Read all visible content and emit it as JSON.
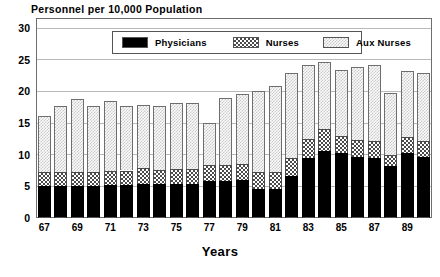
{
  "chart_data": {
    "type": "bar",
    "stacked": true,
    "title": "Personnel per 10,000 Population",
    "xlabel": "Years",
    "ylabel": "",
    "ylim": [
      0,
      30
    ],
    "ytick_step": 5,
    "yticks": [
      0,
      5,
      10,
      15,
      20,
      25,
      30
    ],
    "grid": true,
    "grid_axis": "y",
    "legend_position": "upper-center-inside",
    "categories": [
      "67",
      "68",
      "69",
      "70",
      "71",
      "72",
      "73",
      "74",
      "75",
      "76",
      "77",
      "78",
      "79",
      "80",
      "81",
      "82",
      "83",
      "84",
      "85",
      "86",
      "87",
      "88",
      "89",
      "90"
    ],
    "xtick_labels": [
      "67",
      "69",
      "71",
      "73",
      "75",
      "77",
      "79",
      "81",
      "83",
      "85",
      "87",
      "89"
    ],
    "series": [
      {
        "name": "Physicians",
        "color": "#000000",
        "pattern": "solid",
        "values": [
          5.1,
          5.0,
          5.1,
          5.1,
          5.2,
          5.2,
          5.3,
          5.3,
          5.4,
          5.4,
          5.9,
          5.9,
          6.0,
          4.6,
          4.6,
          6.6,
          9.4,
          10.6,
          10.3,
          9.7,
          9.5,
          8.2,
          10.3,
          9.6
        ]
      },
      {
        "name": "Nurses",
        "color": "#4a4a4a",
        "pattern": "checkered",
        "values": [
          2.1,
          2.2,
          2.2,
          2.2,
          2.2,
          2.3,
          2.6,
          2.3,
          2.3,
          2.4,
          2.5,
          2.4,
          2.6,
          2.6,
          2.6,
          2.9,
          3.1,
          3.5,
          2.6,
          2.6,
          2.6,
          1.8,
          2.5,
          2.6
        ]
      },
      {
        "name": "Aux Nurses",
        "color": "#c9c9c9",
        "pattern": "dotted",
        "values": [
          8.9,
          10.5,
          11.5,
          10.4,
          11.1,
          10.2,
          9.9,
          10.1,
          10.4,
          10.4,
          6.6,
          10.6,
          11.0,
          12.8,
          13.7,
          13.4,
          11.6,
          10.5,
          10.4,
          11.6,
          12.1,
          9.7,
          10.4,
          10.7
        ]
      }
    ],
    "totals": [
      16.1,
      17.7,
      18.8,
      17.7,
      18.5,
      17.7,
      17.8,
      17.7,
      18.1,
      18.2,
      15.0,
      18.9,
      19.6,
      20.0,
      20.9,
      22.9,
      24.1,
      24.6,
      23.3,
      23.9,
      24.2,
      19.7,
      23.2,
      22.9
    ]
  },
  "legend": {
    "items": [
      {
        "label": "Physicians"
      },
      {
        "label": "Nurses"
      },
      {
        "label": "Aux Nurses"
      }
    ]
  }
}
